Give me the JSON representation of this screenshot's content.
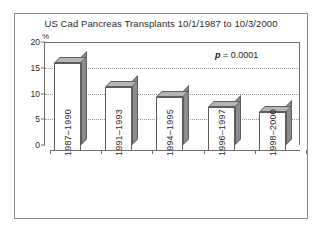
{
  "chart_data": {
    "type": "bar",
    "title": "US Cad Pancreas Transplants 10/1/1987 to 10/3/2000",
    "xlabel": "",
    "ylabel": "%",
    "categories": [
      "1987–1990",
      "1991–1993",
      "1994–1995",
      "1996–1997",
      "1998–2000"
    ],
    "values": [
      17.0,
      12.5,
      10.5,
      8.5,
      7.5
    ],
    "ylim": [
      0,
      20
    ],
    "yticks": [
      0,
      5,
      10,
      15,
      20
    ],
    "ytick_labels": [
      "0",
      "5",
      "10",
      "15",
      "20"
    ],
    "grid": true,
    "legend": false,
    "annotations": [
      {
        "name": "p-value",
        "italic_prefix": "p",
        "text": " = 0.0001"
      }
    ],
    "style": {
      "bar_face": "#ffffff",
      "bar_side": "#8c8c8c",
      "bar_top": "#b5b5b5",
      "bar_edge": "#5d5d5d",
      "axis": "#6e6e6e",
      "grid_color": "#9a9a9a",
      "text": "#2b2b2b",
      "background": "#ffffff",
      "frame": "#8a8a8a"
    }
  },
  "figure": {
    "title": "US Cad Pancreas Transplants 10/1/1987 to 10/3/2000",
    "y_axis_unit": "%",
    "p_value_prefix": "p",
    "p_value_rest": " = 0.0001"
  }
}
